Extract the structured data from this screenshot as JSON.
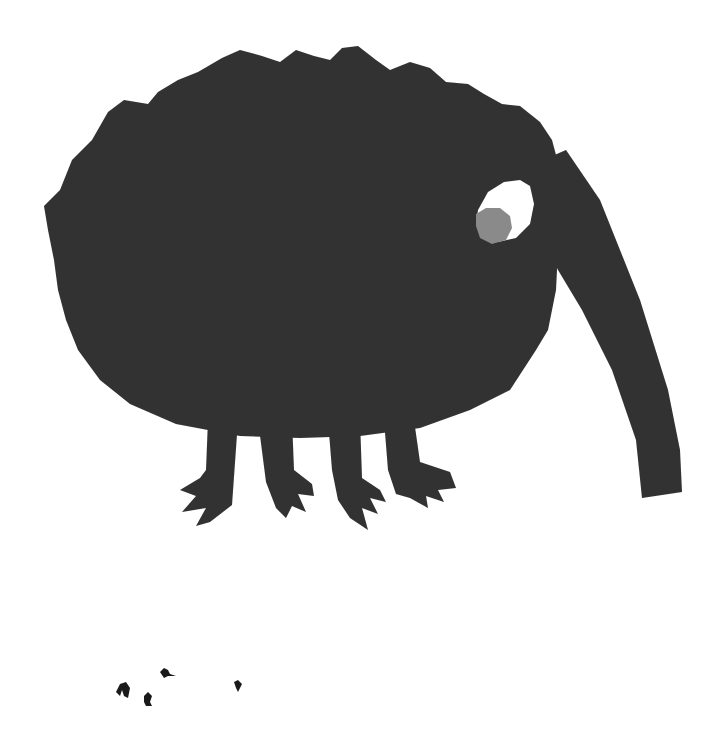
{
  "scene": {
    "title": "Cut-paper elephant-like creature illustration",
    "background_color": "#ffffff",
    "body_color": "#363636",
    "eye_white_color": "#ffffff",
    "pupil_color": "#8a8a8a",
    "creature": {
      "parts": [
        "shaggy-body",
        "trunk",
        "eye",
        "pupil",
        "leg-1",
        "leg-2",
        "leg-3",
        "leg-4"
      ]
    },
    "small_figures_count": 4
  }
}
